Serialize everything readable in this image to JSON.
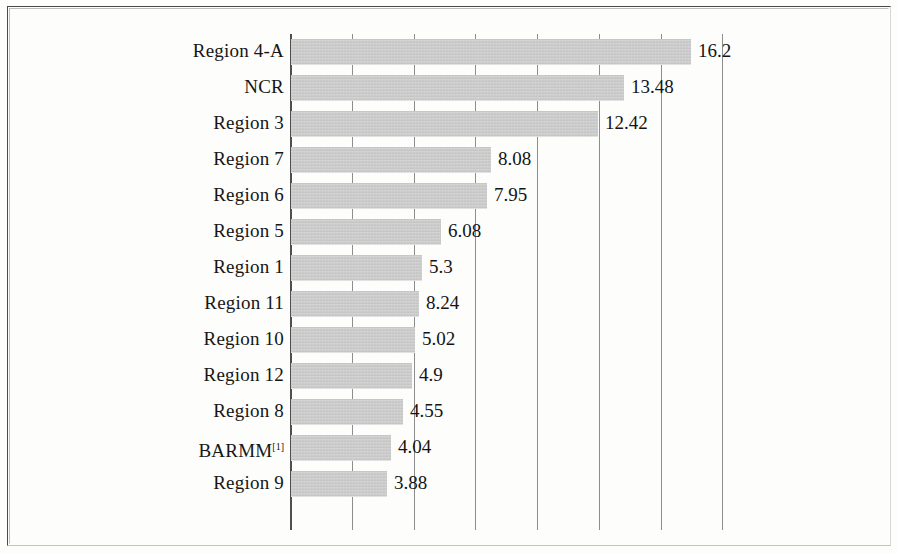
{
  "chart_data": {
    "type": "bar",
    "orientation": "horizontal",
    "title": "",
    "subtitle": "",
    "xlabel": "",
    "ylabel": "",
    "grid": true,
    "legend": false,
    "legend_position": "none",
    "xlim": [
      0,
      17.5
    ],
    "gridline_count": 8,
    "bar_color": "#c9c9c9",
    "categories": [
      "Region 4-A",
      "NCR",
      "Region 3",
      "Region 7",
      "Region 6",
      "Region 5",
      "Region 1",
      "Region 11",
      "Region 10",
      "Region 12",
      "Region 8",
      "BARMM",
      "Region 9"
    ],
    "values": [
      16.2,
      13.48,
      12.42,
      8.08,
      7.95,
      6.08,
      5.3,
      8.24,
      5.02,
      4.9,
      4.55,
      4.04,
      3.88
    ],
    "value_labels": [
      "16.2",
      "13.48",
      "12.42",
      "8.08",
      "7.95",
      "6.08",
      "5.3",
      "8.24",
      "5.02",
      "4.9",
      "4.55",
      "4.04",
      "3.88"
    ],
    "bar_draw_values": [
      16.2,
      13.48,
      12.42,
      8.08,
      7.95,
      6.08,
      5.3,
      5.2,
      5.02,
      4.9,
      4.55,
      4.04,
      3.88
    ],
    "footnote_markers": {
      "BARMM": "[1]"
    }
  },
  "rows": [
    {
      "label": "Region 4-A",
      "sup": "",
      "value_label": "16.2",
      "draw": 16.2
    },
    {
      "label": "NCR",
      "sup": "",
      "value_label": "13.48",
      "draw": 13.48
    },
    {
      "label": "Region 3",
      "sup": "",
      "value_label": "12.42",
      "draw": 12.42
    },
    {
      "label": "Region 7",
      "sup": "",
      "value_label": "8.08",
      "draw": 8.08
    },
    {
      "label": "Region 6",
      "sup": "",
      "value_label": "7.95",
      "draw": 7.95
    },
    {
      "label": "Region 5",
      "sup": "",
      "value_label": "6.08",
      "draw": 6.08
    },
    {
      "label": "Region 1",
      "sup": "",
      "value_label": "5.3",
      "draw": 5.3
    },
    {
      "label": "Region 11",
      "sup": "",
      "value_label": "8.24",
      "draw": 5.2
    },
    {
      "label": "Region 10",
      "sup": "",
      "value_label": "5.02",
      "draw": 5.02
    },
    {
      "label": "Region 12",
      "sup": "",
      "value_label": "4.9",
      "draw": 4.9
    },
    {
      "label": "Region 8",
      "sup": "",
      "value_label": "4.55",
      "draw": 4.55
    },
    {
      "label": "BARMM",
      "sup": "[1]",
      "value_label": "4.04",
      "draw": 4.04
    },
    {
      "label": "Region 9",
      "sup": "",
      "value_label": "3.88",
      "draw": 3.88
    }
  ],
  "axis": {
    "origin_x": 290,
    "px_per_unit": 24.7,
    "gridline_values": [
      0,
      2.5,
      5,
      7.5,
      10,
      12.5,
      15,
      17.5
    ]
  }
}
